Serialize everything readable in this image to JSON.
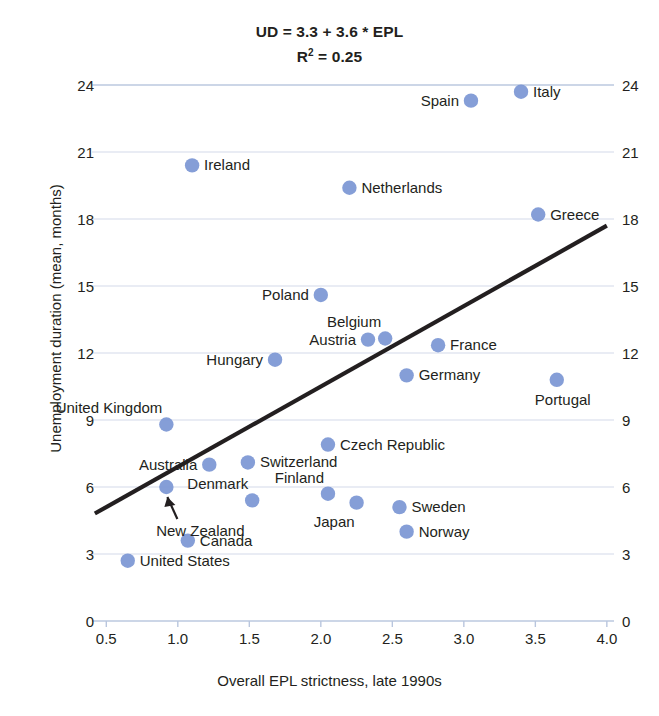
{
  "chart_data": {
    "type": "scatter",
    "title": "UD = 3.3 + 3.6 * EPL",
    "subtitle_prefix": "R",
    "subtitle_sup": "2",
    "subtitle_suffix": " = 0.25",
    "xlabel": "Overall EPL strictness, late 1990s",
    "ylabel": "Unemployment duration (mean, months)",
    "xlim": [
      0.4,
      4.05
    ],
    "ylim": [
      0,
      25
    ],
    "xticks": [
      "0.5",
      "1.0",
      "1.5",
      "2.0",
      "2.5",
      "3.0",
      "3.5",
      "4.0"
    ],
    "xtick_values": [
      0.5,
      1.0,
      1.5,
      2.0,
      2.5,
      3.0,
      3.5,
      4.0
    ],
    "yticks": [
      "0",
      "3",
      "6",
      "9",
      "12",
      "15",
      "18",
      "21",
      "24"
    ],
    "ytick_values": [
      0,
      3,
      6,
      9,
      12,
      15,
      18,
      21,
      24
    ],
    "grid": true,
    "legend": "none",
    "marker_color": "#7b96d4",
    "gridline_color": "#b9c6de",
    "trendline_color": "#231f20",
    "trendline": {
      "intercept": 3.3,
      "slope": 3.6,
      "x_start": 0.42,
      "x_end": 4.0
    },
    "points": [
      {
        "name": "United States",
        "x": 0.65,
        "y": 2.7,
        "label_pos": "right"
      },
      {
        "name": "United Kingdom",
        "x": 0.92,
        "y": 8.8,
        "label_pos": "above-left"
      },
      {
        "name": "New Zealand",
        "x": 0.92,
        "y": 6.0,
        "label_pos": "arrow-below"
      },
      {
        "name": "Canada",
        "x": 1.07,
        "y": 3.6,
        "label_pos": "right"
      },
      {
        "name": "Ireland",
        "x": 1.1,
        "y": 20.4,
        "label_pos": "right"
      },
      {
        "name": "Australia",
        "x": 1.22,
        "y": 7.0,
        "label_pos": "left"
      },
      {
        "name": "Switzerland",
        "x": 1.49,
        "y": 7.1,
        "label_pos": "right"
      },
      {
        "name": "Denmark",
        "x": 1.52,
        "y": 5.4,
        "label_pos": "above-left"
      },
      {
        "name": "Hungary",
        "x": 1.68,
        "y": 11.7,
        "label_pos": "left"
      },
      {
        "name": "Poland",
        "x": 2.0,
        "y": 14.6,
        "label_pos": "left"
      },
      {
        "name": "Czech Republic",
        "x": 2.05,
        "y": 7.9,
        "label_pos": "right"
      },
      {
        "name": "Finland",
        "x": 2.05,
        "y": 5.7,
        "label_pos": "above-left"
      },
      {
        "name": "Netherlands",
        "x": 2.2,
        "y": 19.4,
        "label_pos": "right"
      },
      {
        "name": "Japan",
        "x": 2.25,
        "y": 5.3,
        "label_pos": "below-left"
      },
      {
        "name": "Austria",
        "x": 2.33,
        "y": 12.6,
        "label_pos": "left"
      },
      {
        "name": "Belgium",
        "x": 2.45,
        "y": 12.65,
        "label_pos": "above-left"
      },
      {
        "name": "Sweden",
        "x": 2.55,
        "y": 5.1,
        "label_pos": "right"
      },
      {
        "name": "Norway",
        "x": 2.6,
        "y": 4.0,
        "label_pos": "right"
      },
      {
        "name": "Germany",
        "x": 2.6,
        "y": 11.0,
        "label_pos": "right"
      },
      {
        "name": "France",
        "x": 2.82,
        "y": 12.35,
        "label_pos": "right"
      },
      {
        "name": "Spain",
        "x": 3.05,
        "y": 23.3,
        "label_pos": "left"
      },
      {
        "name": "Portugal",
        "x": 3.65,
        "y": 10.8,
        "label_pos": "below"
      },
      {
        "name": "Greece",
        "x": 3.52,
        "y": 18.2,
        "label_pos": "right"
      },
      {
        "name": "Italy",
        "x": 3.4,
        "y": 23.7,
        "label_pos": "right"
      }
    ]
  }
}
